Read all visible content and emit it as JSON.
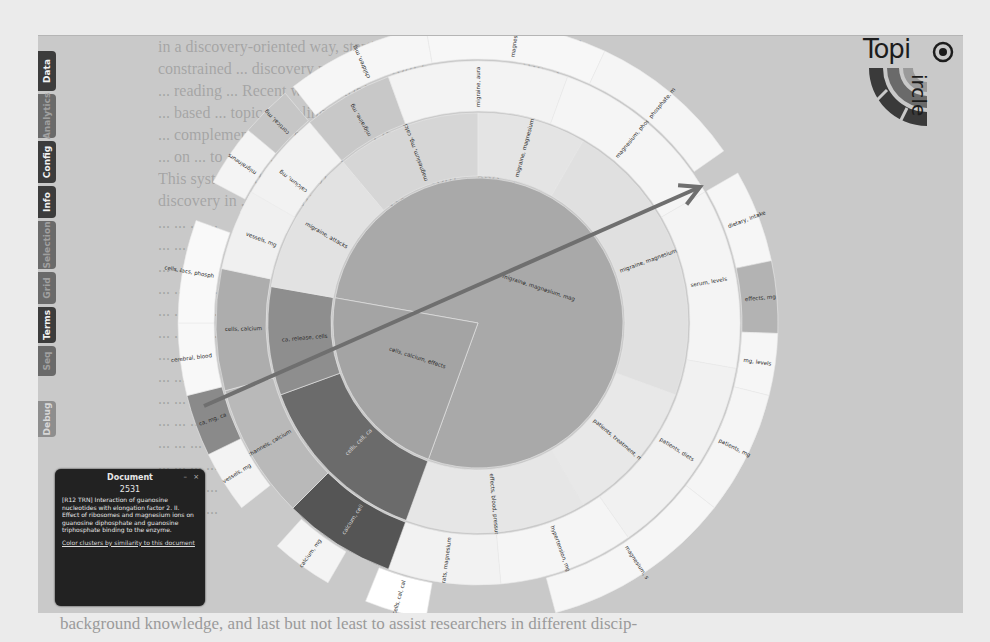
{
  "paper_text": {
    "top_lines": [
      "in a discovery-oriented way, starting from a concept overview and",
      "constrained ... discovery process ... from broad ... to specific ... for a",
      "... reading ... Recent work ... topic ... is based on ... hierarchical",
      "... based ... topic modeling ... with a",
      "... complementary ... navigation ... interactive ...",
      "... on ... to ... the ... of ... to ...",
      "This system and its visualization ... for ... from ... and ...",
      "discovery in ... hierarchies ... for ... user",
      "... ... ... ...",
      "... ... ...",
      "... ... ...",
      "... ... ... ...",
      "... ... ... ...",
      "... ... ... ...",
      "... ... ...",
      "... ... ...",
      "... ... ...",
      "... ... ...",
      "... ... ... ...",
      "... ... ... ...",
      "... ... ... ...",
      "... ... ... ...",
      "... ... ..."
    ],
    "bottom_line": "background knowledge, and last but not least to assist researchers in different discip-"
  },
  "app": {
    "tabs": [
      {
        "label": "Data",
        "state": "active"
      },
      {
        "label": "Analytics",
        "state": "dim"
      },
      {
        "label": "Config",
        "state": "active"
      },
      {
        "label": "Info",
        "state": "active"
      },
      {
        "label": "Selection",
        "state": "dim"
      },
      {
        "label": "Grid",
        "state": "dim"
      },
      {
        "label": "Terms",
        "state": "active"
      },
      {
        "label": "Seq",
        "state": "dim"
      },
      {
        "label": "Debug",
        "state": "debug"
      }
    ],
    "logo": {
      "word1": "Topi",
      "word2": "ircle",
      "name": "TopiCircle"
    },
    "document_panel": {
      "title": "Document",
      "minimize_label": "–",
      "close_label": "×",
      "doc_id": "2531",
      "text": "[R12 TRN] Interaction of guanosine nucleotides with elongation factor 2. II. Effect of ribosomes and magnesium ions on guanosine diphosphate and guanosine triphosphate binding to the enzyme.",
      "link": "Color clusters by similarity to this document"
    },
    "center_label": "migraine, magnesium, mag"
  },
  "sunburst": {
    "center": [
      478,
      322
    ],
    "rings": [
      {
        "r0": 0,
        "r1": 145
      },
      {
        "r0": 147,
        "r1": 210
      },
      {
        "r0": 212,
        "r1": 262
      },
      {
        "r0": 264,
        "r1": 300
      }
    ],
    "segments": [
      {
        "ring": 0,
        "a0": -80,
        "a1": 200,
        "color": "#a9a9a9",
        "label": "migraine, magnesium, mag"
      },
      {
        "ring": 0,
        "a0": 200,
        "a1": 280,
        "color": "#a4a4a4",
        "label": "cells, calcium, effects"
      },
      {
        "ring": 1,
        "a0": -40,
        "a1": 0,
        "color": "#d6d6d6",
        "label": "magnesium, mg, calcium"
      },
      {
        "ring": 1,
        "a0": 0,
        "a1": 30,
        "color": "#e4e4e4",
        "label": "migraine, magnesium, mg"
      },
      {
        "ring": 1,
        "a0": 30,
        "a1": 110,
        "color": "#e0e0e0",
        "label": "migraine, magnesium, magn"
      },
      {
        "ring": 1,
        "a0": 110,
        "a1": 150,
        "color": "#e8e8e8",
        "label": "patients, treatment, mg"
      },
      {
        "ring": 1,
        "a0": 150,
        "a1": 200,
        "color": "#e6e6e6",
        "label": "effects, blood, pressure"
      },
      {
        "ring": 1,
        "a0": 200,
        "a1": 250,
        "color": "#6b6b6b",
        "label": "cells, cell, ca"
      },
      {
        "ring": 1,
        "a0": 250,
        "a1": 280,
        "color": "#8e8e8e",
        "label": "ca, release, cells"
      },
      {
        "ring": 1,
        "a0": 280,
        "a1": 320,
        "color": "#e2e2e2",
        "label": "migraine, attacks"
      },
      {
        "ring": 2,
        "a0": -65,
        "a1": -40,
        "color": "#f2f2f2",
        "label": "calcium, mg"
      },
      {
        "ring": 2,
        "a0": -40,
        "a1": -20,
        "color": "#c8c8c8",
        "label": "migraine, mg"
      },
      {
        "ring": 2,
        "a0": -20,
        "a1": 20,
        "color": "#f3f3f3",
        "label": "migraine, aura"
      },
      {
        "ring": 2,
        "a0": 20,
        "a1": 60,
        "color": "#f5f5f5",
        "label": "magnesium, phosphate"
      },
      {
        "ring": 2,
        "a0": 60,
        "a1": 100,
        "color": "#f4f4f4",
        "label": "serum, levels"
      },
      {
        "ring": 2,
        "a0": 100,
        "a1": 145,
        "color": "#f1f1f1",
        "label": "patients, diets"
      },
      {
        "ring": 2,
        "a0": 145,
        "a1": 175,
        "color": "#f5f5f5",
        "label": "hypertension, mg"
      },
      {
        "ring": 2,
        "a0": 175,
        "a1": 200,
        "color": "#f2f2f2",
        "label": "rats, magnesium"
      },
      {
        "ring": 2,
        "a0": 200,
        "a1": 225,
        "color": "#555555",
        "label": "calcium, cell"
      },
      {
        "ring": 2,
        "a0": 225,
        "a1": 255,
        "color": "#b9b9b9",
        "label": "channels, calcium"
      },
      {
        "ring": 2,
        "a0": 255,
        "a1": 282,
        "color": "#adadad",
        "label": "cells, calcium"
      },
      {
        "ring": 2,
        "a0": 282,
        "a1": 300,
        "color": "#f0f0f0",
        "label": "vessels, mg"
      },
      {
        "ring": 3,
        "a0": -62,
        "a1": -50,
        "color": "#f4f4f4",
        "label": "migraineurs"
      },
      {
        "ring": 3,
        "a0": -50,
        "a1": -40,
        "color": "#c6c6c6",
        "label": "cortical, mg"
      },
      {
        "ring": 3,
        "a0": -38,
        "a1": -10,
        "color": "#f6f6f6",
        "label": "children, mig"
      },
      {
        "ring": 3,
        "a0": -10,
        "a1": 25,
        "color": "#f7f7f7",
        "label": "magnesium, ii"
      },
      {
        "ring": 3,
        "a0": 25,
        "a1": 55,
        "color": "#f5f5f5",
        "label": "phosphate, m"
      },
      {
        "ring": 3,
        "a0": 60,
        "a1": 78,
        "color": "#f6f6f6",
        "label": "dietary, intake"
      },
      {
        "ring": 3,
        "a0": 78,
        "a1": 92,
        "color": "#b3b3b3",
        "label": "effects, mg"
      },
      {
        "ring": 3,
        "a0": 92,
        "a1": 104,
        "color": "#f6f6f6",
        "label": "mg, levels"
      },
      {
        "ring": 3,
        "a0": 104,
        "a1": 128,
        "color": "#f5f5f5",
        "label": "patients, mg"
      },
      {
        "ring": 3,
        "a0": 128,
        "a1": 165,
        "color": "#f6f6f6",
        "label": "magnesium, s"
      },
      {
        "ring": 3,
        "a0": 190,
        "a1": 202,
        "color": "#ffffff",
        "label": "cells, cal, cal"
      },
      {
        "ring": 3,
        "a0": 210,
        "a1": 222,
        "color": "#f4f4f4",
        "label": "calcium, mg"
      },
      {
        "ring": 3,
        "a0": 232,
        "a1": 244,
        "color": "#f3f3f3",
        "label": "vessels, mg"
      },
      {
        "ring": 3,
        "a0": 244,
        "a1": 256,
        "color": "#8a8a8a",
        "label": "ca, mg, ca"
      },
      {
        "ring": 3,
        "a0": 256,
        "a1": 270,
        "color": "#f8f8f8",
        "label": "cerebral, blood"
      },
      {
        "ring": 3,
        "a0": 270,
        "a1": 290,
        "color": "#f9f9f9",
        "label": "cells, lacs, phosph"
      }
    ],
    "arrow": {
      "x1": 204,
      "y1": 405,
      "x2": 700,
      "y2": 186,
      "color": "#6f6f6f"
    }
  }
}
